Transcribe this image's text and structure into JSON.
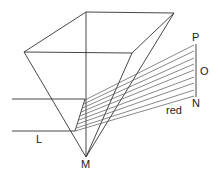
{
  "diagram": {
    "labels": {
      "P": "P",
      "O": "O",
      "N": "N",
      "L": "L",
      "M": "M",
      "red": "red"
    },
    "colors": {
      "line": "#333333",
      "ray": "#555555",
      "background": "#ffffff"
    },
    "ray_count": 9
  }
}
